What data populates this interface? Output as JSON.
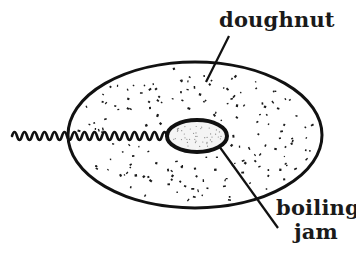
{
  "diagram": {
    "labels": {
      "doughnut": "doughnut",
      "jam_line1": "boiling",
      "jam_line2": "jam"
    },
    "colors": {
      "ink": "#111111",
      "background": "#ffffff"
    },
    "shapes": {
      "doughnut": {
        "cx": 195,
        "cy": 135,
        "rx": 127,
        "ry": 73
      },
      "jam": {
        "cx": 197,
        "cy": 136,
        "rx": 30,
        "ry": 16
      },
      "wave": {
        "x_start": 12,
        "x_end": 167,
        "y": 136,
        "amplitude": 5,
        "period": 10
      }
    }
  }
}
